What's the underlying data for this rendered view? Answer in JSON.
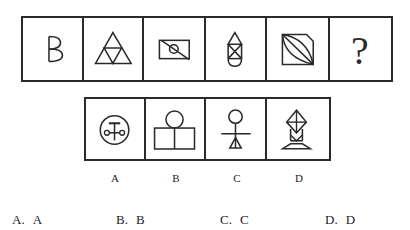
{
  "question": {
    "sequence": [
      {
        "id": "q1",
        "shape": "letter-b-shape"
      },
      {
        "id": "q2",
        "shape": "subdivided-triangle"
      },
      {
        "id": "q3",
        "shape": "rectangle-circle-diagonal"
      },
      {
        "id": "q4",
        "shape": "capsule-with-x"
      },
      {
        "id": "q5",
        "shape": "cut-square-with-lens"
      },
      {
        "id": "q6",
        "shape": "question-mark",
        "text": "?"
      }
    ]
  },
  "candidates": [
    {
      "label": "A",
      "shape": "circle-with-symbol"
    },
    {
      "label": "B",
      "shape": "circle-over-two-boxes"
    },
    {
      "label": "C",
      "shape": "stick-figure"
    },
    {
      "label": "D",
      "shape": "kite-on-stand"
    }
  ],
  "options": [
    {
      "key": "A.",
      "value": "A"
    },
    {
      "key": "B.",
      "value": "B"
    },
    {
      "key": "C.",
      "value": "C"
    },
    {
      "key": "D.",
      "value": "D"
    }
  ],
  "colors": {
    "stroke": "#2a2a2a",
    "background": "#ffffff"
  }
}
